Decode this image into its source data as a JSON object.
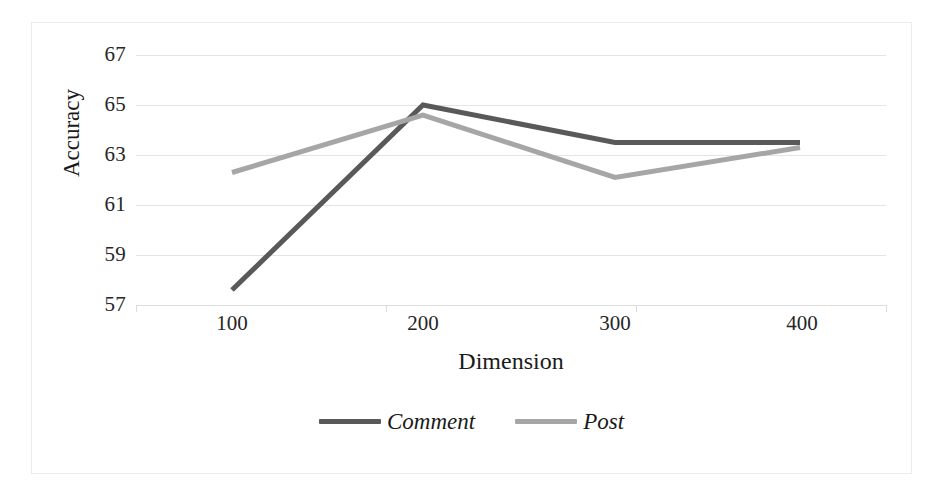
{
  "chart_data": {
    "type": "line",
    "title": "",
    "xlabel": "Dimension",
    "ylabel": "Accuracy",
    "categories": [
      "100",
      "200",
      "300",
      "400"
    ],
    "x": [
      100,
      200,
      300,
      400
    ],
    "xlim": [
      100,
      400
    ],
    "ylim": [
      57,
      67
    ],
    "yticks": [
      57,
      59,
      61,
      63,
      65,
      67
    ],
    "ytick_labels": [
      "57",
      "59",
      "61",
      "63",
      "65",
      "67"
    ],
    "xtick_labels": [
      "100",
      "200",
      "300",
      "400"
    ],
    "grid": "horizontal",
    "legend_position": "bottom-center",
    "series": [
      {
        "name": "Comment",
        "color": "#595959",
        "values": [
          57.6,
          65.0,
          63.5,
          63.5
        ]
      },
      {
        "name": "Post",
        "color": "#a6a6a6",
        "values": [
          62.3,
          64.6,
          62.1,
          63.3
        ]
      }
    ]
  },
  "axes": {
    "y_title": "Accuracy",
    "x_title": "Dimension",
    "y_tick_labels": [
      "67",
      "65",
      "63",
      "61",
      "59",
      "57"
    ],
    "x_tick_labels": [
      "100",
      "200",
      "300",
      "400"
    ]
  },
  "legend": {
    "items": [
      {
        "label": "Comment",
        "color": "#595959"
      },
      {
        "label": "Post",
        "color": "#a6a6a6"
      }
    ]
  },
  "colors": {
    "comment_line": "#595959",
    "post_line": "#a6a6a6",
    "gridline": "#e4e4e4",
    "frame": "#ececec",
    "text": "#1a1a1a",
    "background": "#ffffff"
  }
}
